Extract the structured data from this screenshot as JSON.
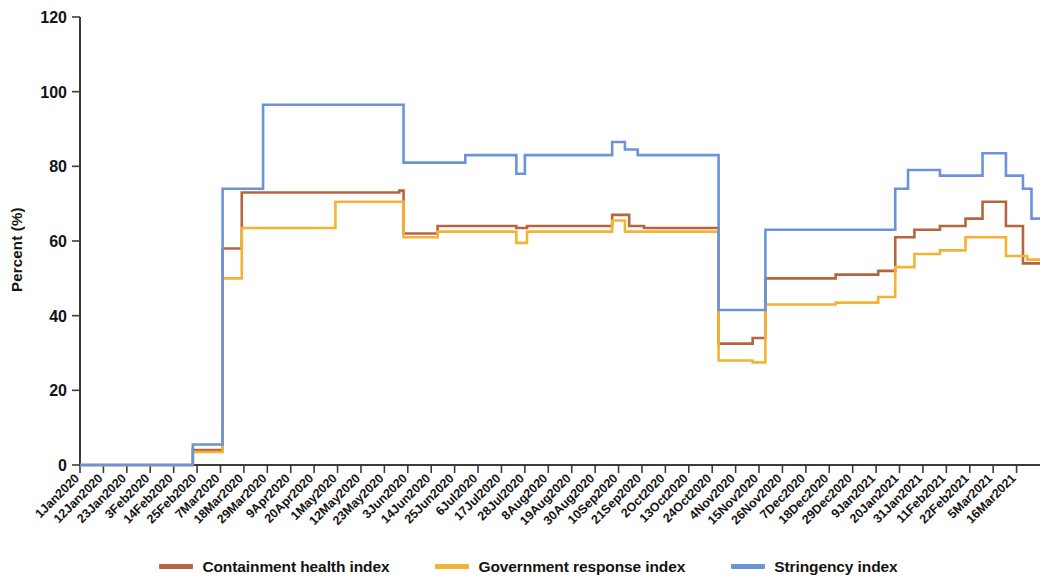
{
  "chart_data": {
    "type": "line",
    "title": "",
    "subtitle": "",
    "xlabel": "",
    "ylabel": "Percent (%)",
    "ylim": [
      0,
      120
    ],
    "ytick_values": [
      0,
      20,
      40,
      60,
      80,
      100,
      120
    ],
    "ytick_labels": [
      "0",
      "20",
      "40",
      "60",
      "80",
      "100",
      "120"
    ],
    "grid": false,
    "legend_position": "bottom",
    "colors": {
      "containment_health_index": "#b5653f",
      "government_response_index": "#f5b335",
      "stringency_index": "#6b93d8"
    },
    "categories": [
      "1Jan2020",
      "12Jan2020",
      "23Jan2020",
      "3Feb2020",
      "14Feb2020",
      "25Feb2020",
      "7Mar2020",
      "18Mar2020",
      "29Mar2020",
      "9Apr2020",
      "20Apr2020",
      "1May2020",
      "12May2020",
      "23May2020",
      "3Jun2020",
      "14Jun2020",
      "25Jun2020",
      "6Jul2020",
      "17Jul2020",
      "28Jul2020",
      "8Aug2020",
      "19Aug2020",
      "30Aug2020",
      "10Sep2020",
      "21Sep2020",
      "2Oct2020",
      "13Oct2020",
      "24Oct2020",
      "4Nov2020",
      "15Nov2020",
      "26Nov2020",
      "7Dec2020",
      "18Dec2020",
      "29Dec2020",
      "9Jan2021",
      "20Jan2021",
      "31Jan2021",
      "11Feb2021",
      "22Feb2021",
      "5Mar2021",
      "16Mar2021"
    ],
    "x_unit_days": 11,
    "series": [
      {
        "name": "Containment health index",
        "color": "#b5653f",
        "steps": [
          {
            "x": 0,
            "y": 0
          },
          {
            "x": 53,
            "y": 0
          },
          {
            "x": 53,
            "y": 4
          },
          {
            "x": 67,
            "y": 4
          },
          {
            "x": 67,
            "y": 58
          },
          {
            "x": 76,
            "y": 58
          },
          {
            "x": 76,
            "y": 73
          },
          {
            "x": 150,
            "y": 73
          },
          {
            "x": 150,
            "y": 73.5
          },
          {
            "x": 152,
            "y": 73.5
          },
          {
            "x": 152,
            "y": 62
          },
          {
            "x": 168,
            "y": 62
          },
          {
            "x": 168,
            "y": 64
          },
          {
            "x": 205,
            "y": 64
          },
          {
            "x": 205,
            "y": 63.5
          },
          {
            "x": 210,
            "y": 63.5
          },
          {
            "x": 210,
            "y": 64
          },
          {
            "x": 250,
            "y": 64
          },
          {
            "x": 250,
            "y": 67
          },
          {
            "x": 258,
            "y": 67
          },
          {
            "x": 258,
            "y": 64
          },
          {
            "x": 265,
            "y": 64
          },
          {
            "x": 265,
            "y": 63.5
          },
          {
            "x": 300,
            "y": 63.5
          },
          {
            "x": 300,
            "y": 32.5
          },
          {
            "x": 316,
            "y": 32.5
          },
          {
            "x": 316,
            "y": 34
          },
          {
            "x": 322,
            "y": 34
          },
          {
            "x": 322,
            "y": 50
          },
          {
            "x": 355,
            "y": 50
          },
          {
            "x": 355,
            "y": 51
          },
          {
            "x": 375,
            "y": 51
          },
          {
            "x": 375,
            "y": 52
          },
          {
            "x": 383,
            "y": 52
          },
          {
            "x": 383,
            "y": 61
          },
          {
            "x": 392,
            "y": 61
          },
          {
            "x": 392,
            "y": 63
          },
          {
            "x": 404,
            "y": 63
          },
          {
            "x": 404,
            "y": 64
          },
          {
            "x": 416,
            "y": 64
          },
          {
            "x": 416,
            "y": 66
          },
          {
            "x": 424,
            "y": 66
          },
          {
            "x": 424,
            "y": 70.5
          },
          {
            "x": 435,
            "y": 70.5
          },
          {
            "x": 435,
            "y": 64
          },
          {
            "x": 443,
            "y": 64
          },
          {
            "x": 443,
            "y": 54
          },
          {
            "x": 451,
            "y": 54
          }
        ]
      },
      {
        "name": "Government response index",
        "color": "#f5b335",
        "steps": [
          {
            "x": 0,
            "y": 0
          },
          {
            "x": 53,
            "y": 0
          },
          {
            "x": 53,
            "y": 3.5
          },
          {
            "x": 67,
            "y": 3.5
          },
          {
            "x": 67,
            "y": 50
          },
          {
            "x": 76,
            "y": 50
          },
          {
            "x": 76,
            "y": 63.5
          },
          {
            "x": 120,
            "y": 63.5
          },
          {
            "x": 120,
            "y": 70.5
          },
          {
            "x": 152,
            "y": 70.5
          },
          {
            "x": 152,
            "y": 61
          },
          {
            "x": 168,
            "y": 61
          },
          {
            "x": 168,
            "y": 62.5
          },
          {
            "x": 205,
            "y": 62.5
          },
          {
            "x": 205,
            "y": 59.5
          },
          {
            "x": 210,
            "y": 59.5
          },
          {
            "x": 210,
            "y": 62.5
          },
          {
            "x": 250,
            "y": 62.5
          },
          {
            "x": 250,
            "y": 65.5
          },
          {
            "x": 256,
            "y": 65.5
          },
          {
            "x": 256,
            "y": 62.5
          },
          {
            "x": 300,
            "y": 62.5
          },
          {
            "x": 300,
            "y": 28
          },
          {
            "x": 316,
            "y": 28
          },
          {
            "x": 316,
            "y": 27.5
          },
          {
            "x": 322,
            "y": 27.5
          },
          {
            "x": 322,
            "y": 43
          },
          {
            "x": 355,
            "y": 43
          },
          {
            "x": 355,
            "y": 43.5
          },
          {
            "x": 375,
            "y": 43.5
          },
          {
            "x": 375,
            "y": 45
          },
          {
            "x": 383,
            "y": 45
          },
          {
            "x": 383,
            "y": 53
          },
          {
            "x": 392,
            "y": 53
          },
          {
            "x": 392,
            "y": 56.5
          },
          {
            "x": 404,
            "y": 56.5
          },
          {
            "x": 404,
            "y": 57.5
          },
          {
            "x": 416,
            "y": 57.5
          },
          {
            "x": 416,
            "y": 61
          },
          {
            "x": 435,
            "y": 61
          },
          {
            "x": 435,
            "y": 56
          },
          {
            "x": 445,
            "y": 56
          },
          {
            "x": 445,
            "y": 55
          },
          {
            "x": 451,
            "y": 55
          }
        ]
      },
      {
        "name": "Stringency index",
        "color": "#6b93d8",
        "steps": [
          {
            "x": 0,
            "y": 0
          },
          {
            "x": 53,
            "y": 0
          },
          {
            "x": 53,
            "y": 5.5
          },
          {
            "x": 67,
            "y": 5.5
          },
          {
            "x": 67,
            "y": 74
          },
          {
            "x": 86,
            "y": 74
          },
          {
            "x": 86,
            "y": 96.5
          },
          {
            "x": 152,
            "y": 96.5
          },
          {
            "x": 152,
            "y": 81
          },
          {
            "x": 181,
            "y": 81
          },
          {
            "x": 181,
            "y": 83
          },
          {
            "x": 205,
            "y": 83
          },
          {
            "x": 205,
            "y": 78
          },
          {
            "x": 209,
            "y": 78
          },
          {
            "x": 209,
            "y": 83
          },
          {
            "x": 250,
            "y": 83
          },
          {
            "x": 250,
            "y": 86.5
          },
          {
            "x": 256,
            "y": 86.5
          },
          {
            "x": 256,
            "y": 84.5
          },
          {
            "x": 262,
            "y": 84.5
          },
          {
            "x": 262,
            "y": 83
          },
          {
            "x": 300,
            "y": 83
          },
          {
            "x": 300,
            "y": 41.5
          },
          {
            "x": 316,
            "y": 41.5
          },
          {
            "x": 316,
            "y": 41.5
          },
          {
            "x": 322,
            "y": 41.5
          },
          {
            "x": 322,
            "y": 63
          },
          {
            "x": 383,
            "y": 63
          },
          {
            "x": 383,
            "y": 74
          },
          {
            "x": 389,
            "y": 74
          },
          {
            "x": 389,
            "y": 79
          },
          {
            "x": 404,
            "y": 79
          },
          {
            "x": 404,
            "y": 77.5
          },
          {
            "x": 424,
            "y": 77.5
          },
          {
            "x": 424,
            "y": 83.5
          },
          {
            "x": 435,
            "y": 83.5
          },
          {
            "x": 435,
            "y": 77.5
          },
          {
            "x": 443,
            "y": 77.5
          },
          {
            "x": 443,
            "y": 74
          },
          {
            "x": 447,
            "y": 74
          },
          {
            "x": 447,
            "y": 66
          },
          {
            "x": 451,
            "y": 66
          }
        ]
      }
    ]
  },
  "legend": {
    "items": [
      {
        "label": "Containment health index",
        "color": "#b5653f"
      },
      {
        "label": "Government response index",
        "color": "#f5b335"
      },
      {
        "label": "Stringency index",
        "color": "#6b93d8"
      }
    ]
  }
}
